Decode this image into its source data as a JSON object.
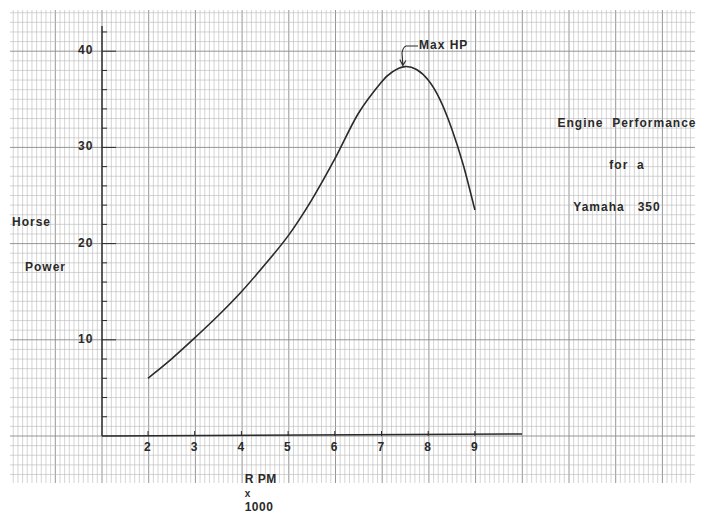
{
  "chart_data": {
    "type": "line",
    "title": "Engine Performance for a Yamaha 350",
    "title_lines": [
      "Engine  Performance",
      "for  a",
      "Yamaha   350"
    ],
    "xlabel": "RPM x 1000",
    "xlabel_parts": {
      "main": "R PM",
      "times": "x",
      "unit": "1000"
    },
    "ylabel": "Horse Power",
    "ylabel_lines": [
      "Horse",
      "Power"
    ],
    "x_ticks": [
      2,
      3,
      4,
      5,
      6,
      7,
      8,
      9
    ],
    "y_ticks": [
      10,
      20,
      30,
      40
    ],
    "xlim": [
      1,
      10
    ],
    "ylim": [
      0,
      42
    ],
    "grid": true,
    "annotation": {
      "text": "Max HP",
      "x": 7.5,
      "y": 38.4
    },
    "series": [
      {
        "name": "Horse Power",
        "x": [
          2.0,
          2.5,
          3.0,
          3.5,
          4.0,
          4.5,
          5.0,
          5.5,
          6.0,
          6.5,
          7.0,
          7.25,
          7.5,
          7.75,
          8.0,
          8.25,
          8.5,
          8.75,
          9.0
        ],
        "values": [
          6.0,
          8.0,
          10.2,
          12.5,
          15.0,
          17.8,
          20.8,
          24.5,
          28.8,
          33.5,
          36.8,
          37.9,
          38.4,
          38.1,
          37.0,
          35.0,
          32.0,
          28.2,
          23.5
        ]
      }
    ]
  },
  "colors": {
    "paper": "#ffffff",
    "grid_minor": "#b8b8b8",
    "grid_major": "#8a8a8a",
    "ink": "#2a2a2a"
  }
}
